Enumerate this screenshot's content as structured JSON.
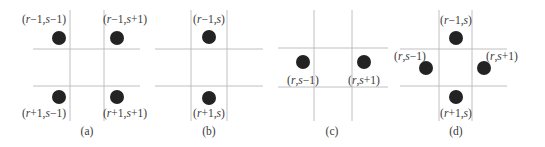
{
  "figure": {
    "panels": [
      {
        "id": "a",
        "caption": "(a)",
        "caption_pos": [
          87,
          135
        ],
        "vlines": [
          [
            70,
            10,
            70,
            121
          ],
          [
            104,
            10,
            104,
            121
          ]
        ],
        "hlines": [
          [
            33,
            49,
            140,
            49
          ],
          [
            33,
            86,
            140,
            86
          ]
        ],
        "dots": [
          {
            "cx": 59,
            "cy": 38,
            "r": 7,
            "label": "(r−1,s−1)",
            "lx": 44,
            "ly": 23
          },
          {
            "cx": 117,
            "cy": 38,
            "r": 7,
            "label": "(r−1,s+1)",
            "lx": 125,
            "ly": 23
          },
          {
            "cx": 59,
            "cy": 97,
            "r": 7,
            "label": "(r+1,s−1)",
            "lx": 44,
            "ly": 117
          },
          {
            "cx": 117,
            "cy": 97,
            "r": 7,
            "label": "(r+1,s+1)",
            "lx": 125,
            "ly": 117
          }
        ]
      },
      {
        "id": "b",
        "caption": "(b)",
        "caption_pos": [
          209,
          135
        ],
        "vlines": [
          [
            191,
            10,
            191,
            121
          ],
          [
            227,
            10,
            227,
            121
          ]
        ],
        "hlines": [
          [
            155,
            49,
            263,
            49
          ],
          [
            155,
            86,
            263,
            86
          ]
        ],
        "dots": [
          {
            "cx": 209,
            "cy": 37,
            "r": 7,
            "label": "(r−1,s)",
            "lx": 209,
            "ly": 23
          },
          {
            "cx": 209,
            "cy": 98,
            "r": 7,
            "label": "(r+1,s)",
            "lx": 209,
            "ly": 117
          }
        ]
      },
      {
        "id": "c",
        "caption": "(c)",
        "caption_pos": [
          332,
          135
        ],
        "vlines": [
          [
            314,
            10,
            314,
            121
          ],
          [
            352,
            10,
            352,
            121
          ]
        ],
        "hlines": [
          [
            278,
            48,
            388,
            48
          ],
          [
            278,
            87,
            388,
            87
          ]
        ],
        "dots": [
          {
            "cx": 303,
            "cy": 62,
            "r": 7,
            "label": "(r,s−1)",
            "lx": 303,
            "ly": 84
          },
          {
            "cx": 364,
            "cy": 62,
            "r": 7,
            "label": "(r,s+1)",
            "lx": 364,
            "ly": 84
          }
        ]
      },
      {
        "id": "d",
        "caption": "(d)",
        "caption_pos": [
          456,
          135
        ],
        "vlines": [
          [
            439,
            10,
            439,
            121
          ],
          [
            472,
            10,
            472,
            121
          ]
        ],
        "hlines": [
          [
            400,
            49,
            507,
            49
          ],
          [
            400,
            86,
            507,
            86
          ]
        ],
        "dots": [
          {
            "cx": 456,
            "cy": 38,
            "r": 7,
            "label": "(r−1,s)",
            "lx": 456,
            "ly": 24
          },
          {
            "cx": 426,
            "cy": 68,
            "r": 7,
            "label": "(r,s−1)",
            "lx": 410,
            "ly": 60
          },
          {
            "cx": 484,
            "cy": 68,
            "r": 7,
            "label": "(r,s+1)",
            "lx": 502,
            "ly": 60
          },
          {
            "cx": 456,
            "cy": 97,
            "r": 7,
            "label": "(r+1,s)",
            "lx": 456,
            "ly": 117
          }
        ]
      }
    ]
  }
}
